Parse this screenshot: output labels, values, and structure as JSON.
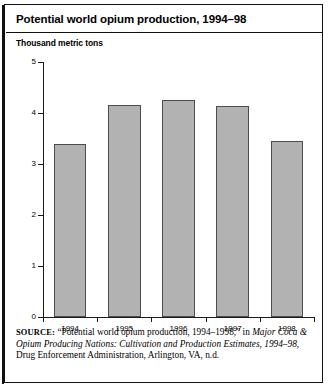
{
  "figure": {
    "title": "Potential world opium production, 1994–98",
    "units_label": "Thousand metric tons",
    "source_label": "SOURCE:",
    "source_part1": " “Potential world opium production, 1994–1998,” in ",
    "source_italic1": "Major Coca & Opium Producing Nations: Cultivation and Production Estimates, 1994–98",
    "source_part2": ", Drug Enforcement Administration, Arlington, VA, n.d."
  },
  "chart_data": {
    "type": "bar",
    "title": "Potential world opium production, 1994–98",
    "xlabel": "",
    "ylabel": "Thousand metric tons",
    "categories": [
      "1994",
      "1995",
      "1996",
      "1997",
      "1998"
    ],
    "values": [
      3.4,
      4.15,
      4.25,
      4.13,
      3.45
    ],
    "ylim": [
      0,
      5
    ],
    "yticks": [
      0,
      1,
      2,
      3,
      4,
      5
    ],
    "ytick_labels": [
      "0",
      "1",
      "2",
      "3",
      "4",
      "5"
    ],
    "grid": false,
    "legend": false,
    "bar_fill_color": "#b2b2b2",
    "bar_border_color": "#4d4d4d",
    "axis_color": "#1a1a1a"
  }
}
